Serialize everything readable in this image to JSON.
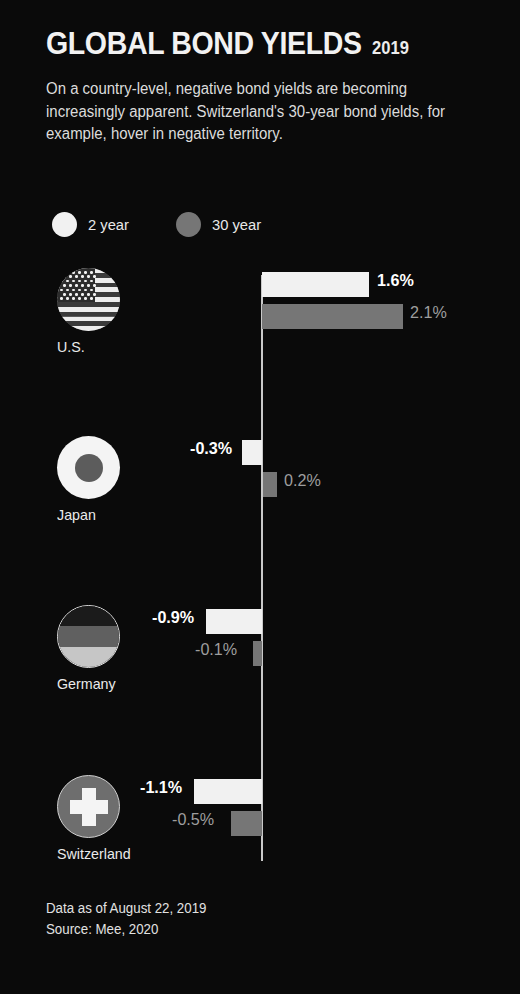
{
  "header": {
    "title": "GLOBAL BOND YIELDS",
    "year": "2019",
    "subtitle": "On a country-level, negative bond yields are becoming increasingly apparent. Switzerland's 30-year bond yields, for example, hover in negative territory."
  },
  "legend": {
    "items": [
      {
        "label": "2 year",
        "color": "#f1f1f1",
        "icon": "circle-icon"
      },
      {
        "label": "30 year",
        "color": "#767676",
        "icon": "circle-icon"
      }
    ]
  },
  "footer": {
    "line1": "Data as of August 22, 2019",
    "line2": "Source: Mee, 2020"
  },
  "chart_data": {
    "type": "bar",
    "title": "GLOBAL BOND YIELDS 2019",
    "xlabel": "",
    "ylabel": "",
    "orientation": "horizontal",
    "grid": false,
    "legend_position": "top-left",
    "zero_axis": true,
    "xlim": [
      -1.3,
      2.4
    ],
    "unit": "%",
    "categories": [
      "U.S.",
      "Japan",
      "Germany",
      "Switzerland"
    ],
    "series": [
      {
        "name": "2 year",
        "color": "#f1f1f1",
        "values": [
          1.6,
          -0.3,
          -0.9,
          -1.1
        ],
        "labels": [
          "1.6%",
          "-0.3%",
          "-0.9%",
          "-1.1%"
        ]
      },
      {
        "name": "30 year",
        "color": "#767676",
        "values": [
          2.1,
          0.2,
          -0.1,
          -0.5
        ],
        "labels": [
          "2.1%",
          "0.2%",
          "-0.1%",
          "-0.5%"
        ]
      }
    ]
  },
  "rows": [
    {
      "country": "U.S.",
      "flag": "flag-united-states-icon",
      "bar_2y": {
        "label": "1.6%",
        "value": 1.6
      },
      "bar_30y": {
        "label": "2.1%",
        "value": 2.1
      }
    },
    {
      "country": "Japan",
      "flag": "flag-japan-icon",
      "bar_2y": {
        "label": "-0.3%",
        "value": -0.3
      },
      "bar_30y": {
        "label": "0.2%",
        "value": 0.2
      }
    },
    {
      "country": "Germany",
      "flag": "flag-germany-icon",
      "bar_2y": {
        "label": "-0.9%",
        "value": -0.9
      },
      "bar_30y": {
        "label": "-0.1%",
        "value": -0.1
      }
    },
    {
      "country": "Switzerland",
      "flag": "flag-switzerland-icon",
      "bar_2y": {
        "label": "-1.1%",
        "value": -1.1
      },
      "bar_30y": {
        "label": "-0.5%",
        "value": -0.5
      }
    }
  ],
  "colors": {
    "background": "#0a0a0a",
    "bar_2_year": "#f1f1f1",
    "bar_30_year": "#767676",
    "axis": "#c9c9c9",
    "text": "#ebebeb",
    "value_30y_text": "#9e9e9e"
  }
}
